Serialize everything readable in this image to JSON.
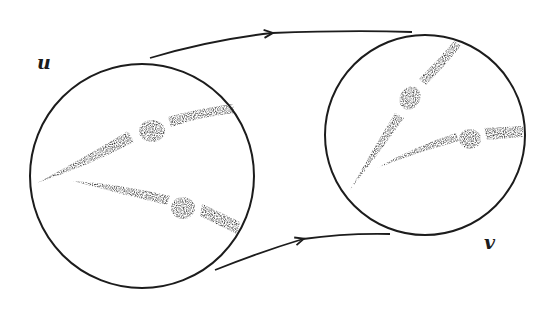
{
  "diagram": {
    "colors": {
      "background": "#ffffff",
      "ink": "#1c1c1c",
      "stipple": "#2a2a2a"
    },
    "nodes": [
      {
        "id": "u",
        "label": "u",
        "shape": "circle",
        "cx": 142,
        "cy": 176,
        "r": 112
      },
      {
        "id": "v",
        "label": "v",
        "shape": "circle",
        "cx": 425,
        "cy": 135,
        "r": 100
      }
    ],
    "edges": [
      {
        "id": "top-arrow",
        "from": "u",
        "to": "v",
        "direction": "right"
      },
      {
        "id": "bottom-arrow",
        "from": "u",
        "to": "v",
        "direction": "right"
      }
    ],
    "labels": {
      "u": "u",
      "v": "v"
    }
  }
}
